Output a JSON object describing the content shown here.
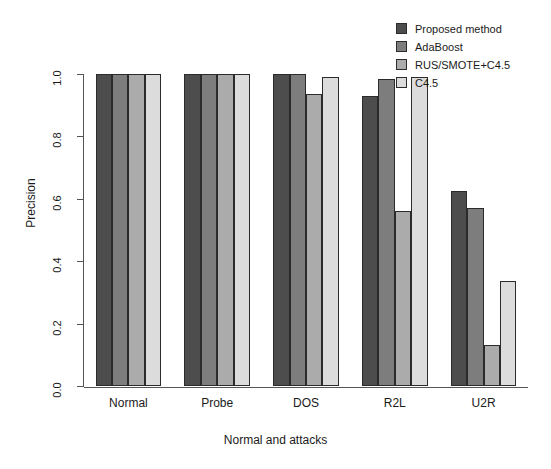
{
  "chart_data": {
    "type": "bar",
    "title": "",
    "xlabel": "Normal and attacks",
    "ylabel": "Precision",
    "ylim": [
      0.0,
      1.0
    ],
    "ytick_labels": [
      "0.0",
      "0.2",
      "0.4",
      "0.6",
      "0.8",
      "1.0"
    ],
    "ytick_values": [
      0.0,
      0.2,
      0.4,
      0.6,
      0.8,
      1.0
    ],
    "grid": false,
    "legend_position": "top-right",
    "categories": [
      "Normal",
      "Probe",
      "DOS",
      "R2L",
      "U2R"
    ],
    "series": [
      {
        "name": "Proposed method",
        "color": "#4d4d4d",
        "values": [
          1.0,
          1.0,
          1.0,
          0.93,
          0.625
        ]
      },
      {
        "name": "AdaBoost",
        "color": "#7d7d7d",
        "values": [
          1.0,
          1.0,
          1.0,
          0.985,
          0.57
        ]
      },
      {
        "name": "RUS/SMOTE+C4.5",
        "color": "#ababab",
        "values": [
          1.0,
          1.0,
          0.935,
          0.56,
          0.13
        ]
      },
      {
        "name": "C4.5",
        "color": "#dcdcdc",
        "values": [
          1.0,
          1.0,
          0.99,
          0.99,
          0.335
        ]
      }
    ]
  },
  "axes": {
    "y_title": "Precision",
    "x_title": "Normal and attacks"
  }
}
